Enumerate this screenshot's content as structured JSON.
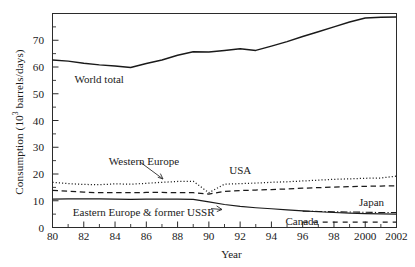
{
  "chart_data": {
    "type": "line",
    "title": "",
    "xlabel": "Year",
    "ylabel": "Consumption (10^3 barrels/days)",
    "ylabel_prefix": "Consumption (10",
    "ylabel_sup": "3",
    "ylabel_suffix": " barrels/days)",
    "xlim": [
      1980,
      2002
    ],
    "ylim": [
      0,
      80
    ],
    "grid": false,
    "legend_position": "inline-annotations",
    "x": [
      1980,
      1981,
      1982,
      1983,
      1984,
      1985,
      1986,
      1987,
      1988,
      1989,
      1990,
      1991,
      1992,
      1993,
      1994,
      1995,
      1996,
      1997,
      1998,
      1999,
      2000,
      2001,
      2002
    ],
    "xtick_labels": [
      "80",
      "82",
      "84",
      "86",
      "88",
      "90",
      "92",
      "94",
      "96",
      "98",
      "2000",
      "2002"
    ],
    "xtick_values": [
      1980,
      1982,
      1984,
      1986,
      1988,
      1990,
      1992,
      1994,
      1996,
      1998,
      2000,
      2002
    ],
    "ytick_labels": [
      "0",
      "10",
      "20",
      "30",
      "40",
      "50",
      "60",
      "70"
    ],
    "ytick_values": [
      0,
      10,
      20,
      30,
      40,
      50,
      60,
      70
    ],
    "series": [
      {
        "name": "World total",
        "style": "solid",
        "values": [
          62.6,
          62.2,
          61.4,
          60.8,
          60.4,
          59.8,
          61.3,
          62.6,
          64.4,
          65.7,
          65.6,
          66.2,
          66.8,
          66.2,
          67.8,
          69.5,
          71.4,
          73.2,
          75.0,
          76.8,
          78.3,
          78.6,
          78.7
        ]
      },
      {
        "name": "USA",
        "style": "dotted",
        "values": [
          16.9,
          16.4,
          16.1,
          16.0,
          16.3,
          16.2,
          16.5,
          16.9,
          17.2,
          17.3,
          13.0,
          16.2,
          16.4,
          16.6,
          16.9,
          17.1,
          17.4,
          17.7,
          18.0,
          18.2,
          18.4,
          18.5,
          19.2
        ]
      },
      {
        "name": "Western Europe",
        "style": "dashed",
        "values": [
          13.9,
          13.6,
          13.2,
          13.0,
          13.0,
          13.0,
          13.1,
          13.1,
          13.0,
          13.0,
          12.5,
          13.5,
          13.8,
          14.0,
          14.2,
          14.4,
          14.7,
          14.9,
          15.1,
          15.3,
          15.4,
          15.5,
          15.6
        ]
      },
      {
        "name": "Eastern Europe & former USSR",
        "style": "solid-thin",
        "values": [
          10.6,
          10.7,
          10.7,
          10.7,
          10.6,
          10.5,
          10.6,
          10.6,
          10.6,
          10.5,
          9.6,
          8.6,
          7.9,
          7.4,
          7.0,
          6.6,
          6.2,
          5.9,
          5.6,
          5.4,
          5.2,
          5.1,
          5.0
        ]
      },
      {
        "name": "Japan",
        "style": "dash-dot",
        "values": [
          null,
          null,
          null,
          null,
          null,
          null,
          null,
          null,
          null,
          null,
          null,
          null,
          null,
          null,
          null,
          null,
          6.1,
          6.0,
          5.9,
          5.8,
          5.7,
          5.6,
          5.6
        ]
      },
      {
        "name": "Canada",
        "style": "long-dash",
        "values": [
          null,
          null,
          null,
          null,
          null,
          null,
          null,
          null,
          null,
          null,
          null,
          null,
          null,
          null,
          null,
          null,
          2.0,
          2.0,
          2.0,
          2.0,
          2.0,
          2.0,
          2.0
        ]
      }
    ],
    "annotations": [
      {
        "id": "world-total",
        "text": "World total",
        "x": 1981.4,
        "y": 55.0
      },
      {
        "id": "western-europe",
        "text": "Western Europe",
        "x": 1983.6,
        "y": 24.5
      },
      {
        "id": "usa",
        "text": "USA",
        "x": 1991.3,
        "y": 21.0
      },
      {
        "id": "eastern-europe",
        "text": "Eastern Europe & former USSR",
        "x": 1981.3,
        "y": 5.3
      },
      {
        "id": "japan",
        "text": "Japan",
        "x": 1999.6,
        "y": 9.2
      },
      {
        "id": "canada",
        "text": "Canada",
        "x": 1994.9,
        "y": 2.2
      }
    ]
  }
}
